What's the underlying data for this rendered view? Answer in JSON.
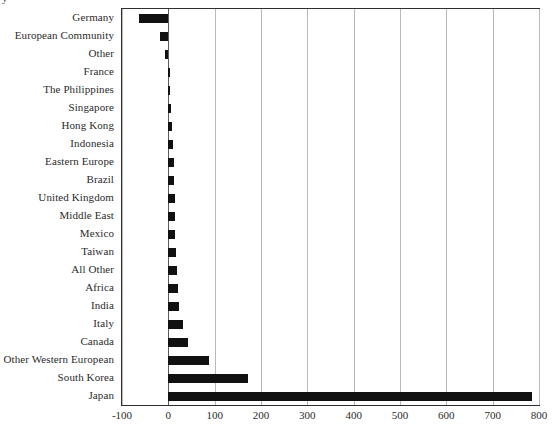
{
  "chart_data": {
    "type": "bar",
    "orientation": "horizontal",
    "title": "",
    "subtitle": "",
    "xlabel": "",
    "ylabel": "",
    "xlim": [
      -100,
      800
    ],
    "ylim": null,
    "grid": true,
    "legend": null,
    "bar_color": "#111111",
    "axis_color": "#2f2f2f",
    "grid_color": "#b9b9b9",
    "xticks": [
      -100,
      0,
      100,
      200,
      300,
      400,
      500,
      600,
      700,
      800
    ],
    "xtick_labels": [
      "-100",
      "0",
      "100",
      "200",
      "300",
      "400",
      "500",
      "600",
      "700",
      "800"
    ],
    "categories": [
      "Germany",
      "European Community",
      "Other",
      "France",
      "The Philippines",
      "Singapore",
      "Hong Kong",
      "Indonesia",
      "Eastern Europe",
      "Brazil",
      "United Kingdom",
      "Middle East",
      "Mexico",
      "Taiwan",
      "All Other",
      "Africa",
      "India",
      "Italy",
      "Canada",
      "Other Western European",
      "South Korea",
      "Japan"
    ],
    "values": [
      -63,
      -18,
      -8,
      1,
      3,
      5,
      9,
      10,
      12,
      13,
      14,
      14,
      15,
      16,
      18,
      21,
      24,
      32,
      43,
      88,
      173,
      785
    ]
  },
  "title_remnant": {
    "text": "y"
  }
}
